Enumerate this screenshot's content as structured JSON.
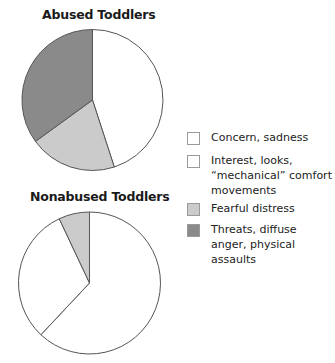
{
  "chart_data": [
    {
      "type": "pie",
      "title": "Abused Toddlers",
      "categories": [
        "Concern, sadness / Interest, looks, “mechanical” comfort movements",
        "Fearful distress",
        "Threats, diffuse anger, physical assaults"
      ],
      "values": [
        45,
        20,
        35
      ],
      "colors": [
        "#ffffff",
        "#cbcbcb",
        "#8a8a8a"
      ],
      "start_angle": "12 o'clock, clockwise"
    },
    {
      "type": "pie",
      "title": "Nonabused Toddlers",
      "categories": [
        "Concern, sadness",
        "Interest, looks, “mechanical” comfort movements",
        "Fearful distress"
      ],
      "values": [
        62,
        31,
        7
      ],
      "colors": [
        "#ffffff",
        "#ffffff",
        "#cbcbcb"
      ],
      "start_angle": "12 o'clock, clockwise"
    }
  ],
  "titles": {
    "abused": "Abused Toddlers",
    "nonabused": "Nonabused Toddlers"
  },
  "legend": {
    "position": "right",
    "items": [
      {
        "label": "Concern, sadness",
        "color": "#ffffff"
      },
      {
        "label": "Interest, looks, “mechanical” comfort movements",
        "color": "#ffffff"
      },
      {
        "label": "Fearful distress",
        "color": "#cbcbcb"
      },
      {
        "label": "Threats, diffuse anger, physical assaults",
        "color": "#8a8a8a"
      }
    ]
  },
  "style": {
    "stroke": "#555555"
  }
}
